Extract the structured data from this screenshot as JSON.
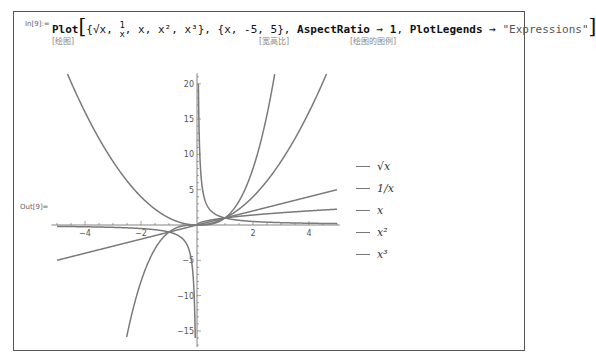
{
  "cell": {
    "in_label": "In[9]:=",
    "out_label": "Out[9]=",
    "code": {
      "func": "Plot",
      "exprs": [
        "√x",
        "1/x",
        "x",
        "x²",
        "x³"
      ],
      "range": "{x, -5, 5}",
      "opt1_name": "AspectRatio",
      "opt1_value": "1",
      "opt2_name": "PlotLegends",
      "opt2_value": "\"Expressions\"",
      "arrow": "→"
    },
    "hints": {
      "plot": "[绘图]",
      "aspect": "[宽高比]",
      "legends": "[绘图的图例]"
    }
  },
  "legend": {
    "items": [
      {
        "label": "√x"
      },
      {
        "label": "1/x"
      },
      {
        "label": "x"
      },
      {
        "label": "x²"
      },
      {
        "label": "x³"
      }
    ]
  },
  "chart_data": {
    "type": "line",
    "title": "",
    "xlabel": "",
    "ylabel": "",
    "xlim": [
      -5,
      5
    ],
    "ylim": [
      -15.5,
      21.5
    ],
    "x_ticks": [
      -4,
      -2,
      2,
      4
    ],
    "y_ticks": [
      -15,
      -10,
      -5,
      5,
      10,
      15,
      20
    ],
    "grid": false,
    "legend_position": "right",
    "line_color": "#7a7a7a",
    "series": [
      {
        "name": "√x",
        "function": "sqrt(x)",
        "domain": [
          0,
          5
        ]
      },
      {
        "name": "1/x",
        "function": "1/x",
        "domain": [
          -5,
          5
        ]
      },
      {
        "name": "x",
        "function": "x",
        "domain": [
          -5,
          5
        ]
      },
      {
        "name": "x^2",
        "function": "x^2",
        "domain": [
          -5,
          5
        ]
      },
      {
        "name": "x^3",
        "function": "x^3",
        "domain": [
          -5,
          5
        ]
      }
    ]
  }
}
